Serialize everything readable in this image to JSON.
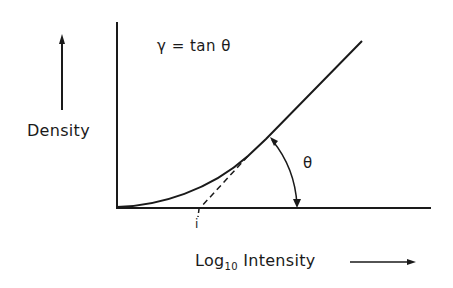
{
  "diagram": {
    "type": "characteristic-curve",
    "formula": "γ = tan θ",
    "ylabel": "Density",
    "xlabel_main": "Log",
    "xlabel_sub": "10",
    "xlabel_rest": " Intensity",
    "angle_label": "θ",
    "intercept_label": "i",
    "colors": {
      "ink": "#1a1a1a",
      "background": "#ffffff"
    }
  }
}
